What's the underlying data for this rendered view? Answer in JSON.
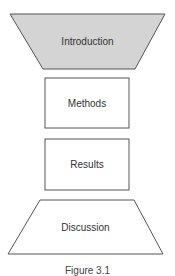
{
  "diagram": {
    "shapes": [
      {
        "id": "introduction",
        "label": "Introduction",
        "shape": "inverted-trapezoid",
        "fill": "#d4d4d4"
      },
      {
        "id": "methods",
        "label": "Methods",
        "shape": "rectangle",
        "fill": "#ffffff"
      },
      {
        "id": "results",
        "label": "Results",
        "shape": "rectangle",
        "fill": "#ffffff"
      },
      {
        "id": "discussion",
        "label": "Discussion",
        "shape": "trapezoid",
        "fill": "#ffffff"
      }
    ],
    "caption": "Figure 3.1",
    "stroke_color": "#555555"
  }
}
